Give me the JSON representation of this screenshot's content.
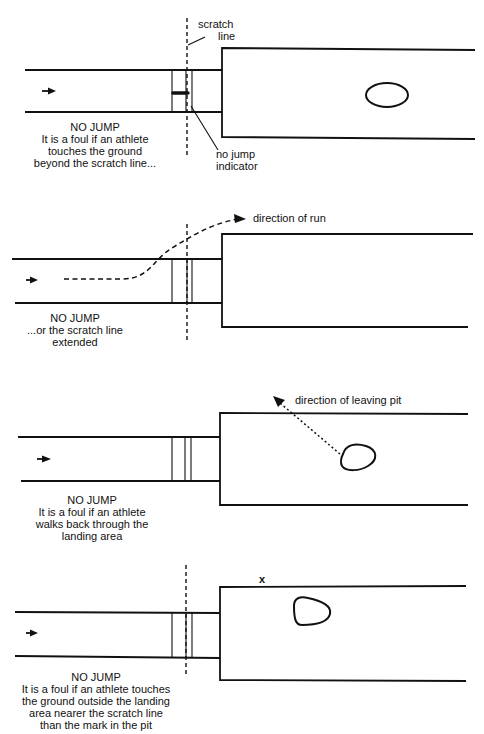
{
  "colors": {
    "ink": "#111111",
    "background": "#ffffff"
  },
  "panels": [
    {
      "id": "beyond-scratch-line",
      "runway": {
        "x1": 25,
        "x2": 222,
        "top": 70,
        "bottom": 112
      },
      "board_lines_x": [
        172,
        186,
        192
      ],
      "pit": {
        "left": 222,
        "right": 475,
        "top": 48,
        "bottom": 137
      },
      "scratch_line": {
        "x": 187,
        "y1": 18,
        "y2": 155,
        "visible": true
      },
      "run_arrow": {
        "x": 42,
        "y": 91
      },
      "mark": {
        "shape": "oval",
        "cx": 387,
        "cy": 95,
        "rx": 21,
        "ry": 12
      },
      "foot_mark": {
        "x1": 172,
        "x2": 188,
        "y": 93
      },
      "labels": {
        "scratch_line": [
          "scratch",
          "line"
        ],
        "no_jump_indicator": [
          "no jump",
          "indicator"
        ]
      },
      "caption": [
        "NO JUMP",
        "It is a foul if an athlete",
        "touches the ground",
        "beyond the scratch line..."
      ],
      "caption_pos": {
        "cx": 95,
        "y": 131
      }
    },
    {
      "id": "scratch-line-extended",
      "runway": {
        "x1": 12,
        "x2": 222,
        "top": 259,
        "bottom": 303
      },
      "board_lines_x": [
        172,
        187,
        192
      ],
      "pit": {
        "left": 222,
        "right": 473,
        "top": 234,
        "bottom": 327
      },
      "scratch_line": {
        "x": 187,
        "y1": 224,
        "y2": 340,
        "visible": true
      },
      "run_arrow": {
        "x": 28,
        "y": 280
      },
      "labels": {
        "direction": "direction of run"
      },
      "caption": [
        "NO JUMP",
        "...or the scratch line",
        "extended"
      ],
      "caption_pos": {
        "cx": 75,
        "y": 319
      }
    },
    {
      "id": "walks-back-through-landing",
      "runway": {
        "x1": 18,
        "x2": 220,
        "top": 437,
        "bottom": 481
      },
      "board_lines_x": [
        172,
        185,
        191
      ],
      "pit": {
        "left": 220,
        "right": 468,
        "top": 413,
        "bottom": 505
      },
      "scratch_line": {
        "visible": false
      },
      "run_arrow": {
        "x": 40,
        "y": 459
      },
      "labels": {
        "direction": "direction of leaving pit"
      },
      "caption": [
        "NO JUMP",
        "It is a foul if an athlete",
        "walks back through the",
        "landing area"
      ],
      "caption_pos": {
        "cx": 92,
        "y": 504
      }
    },
    {
      "id": "touches-outside-landing",
      "runway": {
        "x1": 15,
        "x2": 220,
        "top": 612,
        "bottom": 657
      },
      "board_lines_x": [
        172,
        186,
        192
      ],
      "pit": {
        "left": 220,
        "right": 466,
        "top": 586,
        "bottom": 680
      },
      "scratch_line": {
        "x": 186,
        "y1": 565,
        "y2": 675,
        "visible": true
      },
      "run_arrow": {
        "x": 28,
        "y": 633
      },
      "outside_mark": {
        "label": "x",
        "x": 263,
        "y": 581
      },
      "caption": [
        "NO JUMP",
        "It is a foul if an athlete touches",
        "the ground outside the landing",
        "area nearer the scratch line",
        "than the mark in the pit"
      ],
      "caption_pos": {
        "cx": 96,
        "y": 681
      }
    }
  ]
}
